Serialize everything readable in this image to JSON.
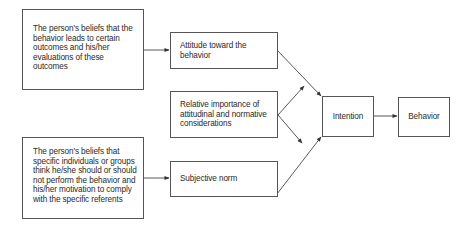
{
  "diagram": {
    "nodes": [
      {
        "id": "beliefs_outcomes",
        "label": "The person's beliefs that the behavior leads to certain outcomes and his/her evaluations of these outcomes"
      },
      {
        "id": "attitude",
        "label": "Attitude toward the behavior"
      },
      {
        "id": "relative_importance",
        "label": "Relative importance of attitudinal and normative considerations"
      },
      {
        "id": "beliefs_referents",
        "label": "The person's beliefs that specific individuals or groups think he/she should or should not perform the behavior and his/her motivation to comply with the specific referents"
      },
      {
        "id": "subjective_norm",
        "label": "Subjective norm"
      },
      {
        "id": "intention",
        "label": "Intention"
      },
      {
        "id": "behavior",
        "label": "Behavior"
      }
    ],
    "edges": [
      {
        "from": "beliefs_outcomes",
        "to": "attitude"
      },
      {
        "from": "beliefs_referents",
        "to": "subjective_norm"
      },
      {
        "from": "attitude",
        "to": "intention"
      },
      {
        "from": "subjective_norm",
        "to": "intention"
      },
      {
        "from": "relative_importance",
        "to": "attitude->intention"
      },
      {
        "from": "relative_importance",
        "to": "subjective_norm->intention"
      },
      {
        "from": "intention",
        "to": "behavior"
      }
    ]
  }
}
